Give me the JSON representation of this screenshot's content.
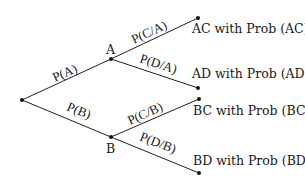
{
  "diagram": {
    "type": "probability-tree",
    "nodes": {
      "root": {
        "label": ""
      },
      "A": {
        "label": "A"
      },
      "B": {
        "label": "B"
      }
    },
    "edges": {
      "root_A": "P(A)",
      "root_B": "P(B)",
      "A_C": "P(C/A)",
      "A_D": "P(D/A)",
      "B_C": "P(C/B)",
      "B_D": "P(D/B)"
    },
    "outcomes": {
      "AC": "AC with Prob (AC)",
      "AD": "AD with Prob (AD)",
      "BC": "BC with Prob (BC)",
      "BD": "BD with Prob (BD)"
    }
  }
}
